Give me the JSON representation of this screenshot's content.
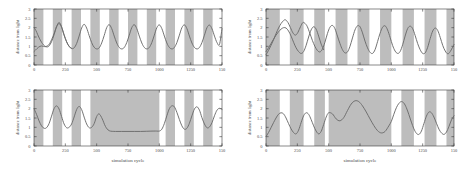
{
  "figure": {
    "background": "#ffffff",
    "axis_color": "#3a3a3a",
    "curve_color": "#6b6b6b",
    "band_color": "#bdbdbd",
    "band_label": "dark phase shading",
    "panel_count": 4
  },
  "axes": {
    "xlabel": "simulation cycle",
    "ylabel": "distance from light",
    "xticks": [
      "0",
      "250",
      "500",
      "750",
      "1000",
      "1250",
      "150"
    ],
    "xtick_values": [
      0,
      250,
      500,
      750,
      1000,
      1250,
      1500
    ],
    "yticks": [
      "0",
      "0.5",
      "1",
      "1.5",
      "2",
      "2.5",
      "3"
    ],
    "ytick_values": [
      0,
      0.5,
      1,
      1.5,
      2,
      2.5,
      3
    ],
    "xlim": [
      0,
      1500
    ],
    "ylim": [
      0,
      3
    ]
  },
  "chart_data": [
    {
      "id": "top-left",
      "type": "line",
      "title": "",
      "xlabel": "",
      "ylabel": "distance from light",
      "xlim": [
        0,
        1500
      ],
      "ylim": [
        0,
        3
      ],
      "grid": false,
      "legend": "none",
      "bands": [
        [
          0,
          75
        ],
        [
          150,
          225
        ],
        [
          300,
          375
        ],
        [
          450,
          525
        ],
        [
          600,
          675
        ],
        [
          750,
          825
        ],
        [
          900,
          975
        ],
        [
          1050,
          1125
        ],
        [
          1200,
          1275
        ],
        [
          1350,
          1425
        ]
      ],
      "series": [
        {
          "name": "agent trajectory A",
          "x": [
            0,
            15,
            30,
            45,
            60,
            75,
            90,
            105,
            120,
            140,
            160,
            180,
            200,
            220,
            240,
            260,
            280,
            300,
            320,
            340,
            360,
            380,
            400,
            420,
            440,
            460,
            480,
            500,
            520,
            540,
            560,
            580,
            600,
            620,
            640,
            660,
            680,
            700,
            720,
            740,
            760,
            780,
            800,
            820,
            840,
            860,
            880,
            900,
            920,
            940,
            960,
            980,
            1000,
            1020,
            1040,
            1060,
            1080,
            1100,
            1120,
            1140,
            1160,
            1180,
            1200,
            1220,
            1240,
            1260,
            1280,
            1300,
            1320,
            1340,
            1360,
            1380,
            1400,
            1420,
            1440,
            1460,
            1480,
            1500
          ],
          "y": [
            2.0,
            1.85,
            1.62,
            1.4,
            1.22,
            1.08,
            1.0,
            0.97,
            1.02,
            1.25,
            1.62,
            2.05,
            2.28,
            2.05,
            1.62,
            1.25,
            1.0,
            0.88,
            0.92,
            1.15,
            1.55,
            1.98,
            2.18,
            1.98,
            1.58,
            1.2,
            0.95,
            0.86,
            0.92,
            1.18,
            1.58,
            2.0,
            2.16,
            1.95,
            1.55,
            1.18,
            0.94,
            0.86,
            0.94,
            1.2,
            1.6,
            2.0,
            2.16,
            1.95,
            1.55,
            1.18,
            0.94,
            0.86,
            0.94,
            1.2,
            1.6,
            2.0,
            2.15,
            1.95,
            1.55,
            1.18,
            0.94,
            0.86,
            0.94,
            1.2,
            1.6,
            2.0,
            2.15,
            1.95,
            1.55,
            1.18,
            0.94,
            0.86,
            0.94,
            1.2,
            1.6,
            2.0,
            2.14,
            1.94,
            1.55,
            1.2,
            1.1,
            1.95
          ]
        },
        {
          "name": "agent trajectory B",
          "x": [
            0,
            12,
            24,
            36,
            48,
            60,
            75,
            90,
            105,
            120,
            140,
            160,
            180,
            200,
            220,
            240,
            260,
            280,
            300
          ],
          "y": [
            0.72,
            0.8,
            0.88,
            0.95,
            1.0,
            1.02,
            1.0,
            0.98,
            1.02,
            1.1,
            1.35,
            1.68,
            2.05,
            2.22,
            2.02,
            1.6,
            1.24,
            1.0,
            0.9
          ]
        }
      ]
    },
    {
      "id": "bottom-left",
      "type": "line",
      "title": "",
      "xlabel": "simulation cycle",
      "ylabel": "distance from light",
      "xlim": [
        0,
        1500
      ],
      "ylim": [
        0,
        3
      ],
      "grid": false,
      "legend": "none",
      "bands": [
        [
          0,
          75
        ],
        [
          150,
          225
        ],
        [
          300,
          375
        ],
        [
          450,
          1000
        ],
        [
          1050,
          1125
        ],
        [
          1200,
          1275
        ],
        [
          1350,
          1425
        ]
      ],
      "series": [
        {
          "name": "agent trajectory",
          "x": [
            0,
            20,
            40,
            60,
            80,
            100,
            120,
            140,
            160,
            180,
            200,
            220,
            240,
            260,
            280,
            300,
            320,
            340,
            360,
            380,
            400,
            420,
            440,
            460,
            480,
            500,
            520,
            545,
            570,
            600,
            650,
            700,
            750,
            800,
            850,
            900,
            950,
            980,
            1000,
            1020,
            1040,
            1060,
            1080,
            1100,
            1120,
            1140,
            1160,
            1180,
            1200,
            1220,
            1240,
            1260,
            1280,
            1300,
            1320,
            1340,
            1360,
            1380,
            1400,
            1420,
            1440,
            1460,
            1480,
            1500
          ],
          "y": [
            2.0,
            1.7,
            1.35,
            1.08,
            0.95,
            0.98,
            1.2,
            1.6,
            2.0,
            2.15,
            1.98,
            1.58,
            1.18,
            0.98,
            1.0,
            1.18,
            1.55,
            1.95,
            2.12,
            1.95,
            1.55,
            1.18,
            0.98,
            1.0,
            1.2,
            1.58,
            1.72,
            1.45,
            1.05,
            0.82,
            0.78,
            0.78,
            0.78,
            0.78,
            0.78,
            0.79,
            0.8,
            0.8,
            0.8,
            0.9,
            1.2,
            1.62,
            2.0,
            2.15,
            2.1,
            1.8,
            1.42,
            1.08,
            0.9,
            0.95,
            1.22,
            1.62,
            1.98,
            2.1,
            1.92,
            1.52,
            1.18,
            0.98,
            1.02,
            1.25,
            1.62,
            1.92,
            2.02,
            1.96
          ]
        }
      ]
    },
    {
      "id": "top-right",
      "type": "line",
      "title": "",
      "xlabel": "",
      "ylabel": "distance from light",
      "xlim": [
        0,
        1500
      ],
      "ylim": [
        0,
        3
      ],
      "grid": false,
      "legend": "none",
      "bands": [
        [
          0,
          110
        ],
        [
          190,
          300
        ],
        [
          385,
          470
        ],
        [
          555,
          650
        ],
        [
          730,
          825
        ],
        [
          910,
          1000
        ],
        [
          1090,
          1180
        ],
        [
          1265,
          1360
        ],
        [
          1440,
          1500
        ]
      ],
      "series": [
        {
          "name": "agent trajectory A",
          "x": [
            0,
            20,
            40,
            60,
            80,
            100,
            120,
            140,
            155,
            175,
            195,
            215,
            235,
            255,
            275,
            295,
            315,
            330,
            350,
            370,
            390,
            410,
            430,
            450,
            470,
            490,
            510,
            530,
            550,
            570,
            590,
            610,
            630,
            650,
            670,
            690,
            710,
            730,
            750,
            770,
            790,
            810,
            830,
            850,
            870,
            890,
            910,
            930,
            950,
            970,
            990,
            1010,
            1030,
            1050,
            1070,
            1090,
            1110,
            1130,
            1150,
            1170,
            1190,
            1210,
            1230,
            1250,
            1270,
            1290,
            1310,
            1330,
            1350,
            1370,
            1390,
            1410,
            1430,
            1450,
            1470,
            1500
          ],
          "y": [
            0.55,
            0.78,
            1.05,
            1.35,
            1.68,
            1.98,
            2.22,
            2.38,
            2.42,
            2.28,
            2.0,
            1.72,
            1.6,
            1.75,
            2.05,
            2.28,
            2.2,
            2.05,
            1.7,
            1.32,
            1.0,
            0.78,
            0.7,
            0.85,
            1.22,
            1.68,
            2.02,
            2.12,
            1.95,
            1.55,
            1.15,
            0.82,
            0.65,
            0.7,
            1.0,
            1.45,
            1.88,
            2.1,
            2.05,
            1.72,
            1.28,
            0.92,
            0.68,
            0.62,
            0.82,
            1.25,
            1.7,
            2.02,
            2.1,
            1.88,
            1.48,
            1.05,
            0.75,
            0.62,
            0.72,
            1.08,
            1.55,
            1.95,
            2.08,
            1.95,
            1.58,
            1.15,
            0.82,
            0.62,
            0.65,
            0.95,
            1.42,
            1.82,
            1.98,
            1.85,
            1.48,
            1.05,
            0.75,
            0.6,
            0.72,
            1.1,
            1.9
          ]
        },
        {
          "name": "agent trajectory B",
          "x": [
            0,
            20,
            40,
            60,
            80,
            100,
            120,
            140,
            160,
            180,
            200,
            220,
            240,
            260,
            280,
            300,
            320,
            340,
            360,
            380,
            400,
            420,
            440,
            460
          ],
          "y": [
            0.72,
            0.92,
            1.15,
            1.38,
            1.6,
            1.78,
            1.92,
            2.0,
            1.98,
            1.82,
            1.55,
            1.22,
            0.92,
            0.72,
            0.62,
            0.72,
            1.05,
            1.5,
            1.88,
            2.05,
            1.92,
            1.55,
            1.12,
            0.82
          ]
        }
      ]
    },
    {
      "id": "bottom-right",
      "type": "line",
      "title": "",
      "xlabel": "simulation cycle",
      "ylabel": "distance from light",
      "xlim": [
        0,
        1500
      ],
      "ylim": [
        0,
        3
      ],
      "grid": false,
      "legend": "none",
      "bands": [
        [
          0,
          110
        ],
        [
          190,
          300
        ],
        [
          385,
          470
        ],
        [
          500,
          1000
        ],
        [
          1080,
          1180
        ],
        [
          1265,
          1360
        ],
        [
          1440,
          1500
        ]
      ],
      "series": [
        {
          "name": "agent trajectory",
          "x": [
            0,
            20,
            40,
            60,
            80,
            100,
            120,
            140,
            160,
            180,
            200,
            220,
            240,
            260,
            280,
            300,
            320,
            340,
            360,
            380,
            400,
            420,
            440,
            460,
            480,
            500,
            530,
            560,
            590,
            620,
            650,
            680,
            710,
            740,
            770,
            800,
            830,
            860,
            890,
            920,
            950,
            980,
            1000,
            1020,
            1040,
            1060,
            1080,
            1100,
            1120,
            1140,
            1160,
            1180,
            1200,
            1220,
            1240,
            1260,
            1280,
            1300,
            1320,
            1340,
            1360,
            1380,
            1400,
            1420,
            1440,
            1460,
            1480,
            1500
          ],
          "y": [
            0.5,
            0.72,
            0.98,
            1.25,
            1.5,
            1.7,
            1.78,
            1.72,
            1.5,
            1.2,
            0.92,
            0.72,
            0.65,
            0.85,
            1.25,
            1.62,
            1.78,
            1.7,
            1.42,
            1.08,
            0.8,
            0.65,
            0.78,
            1.15,
            1.55,
            1.78,
            1.72,
            1.45,
            1.35,
            1.52,
            1.9,
            2.25,
            2.42,
            2.38,
            2.15,
            1.82,
            1.45,
            1.1,
            0.82,
            0.7,
            0.78,
            1.08,
            1.32,
            1.7,
            2.05,
            2.28,
            2.38,
            2.3,
            2.05,
            1.68,
            1.28,
            0.92,
            0.68,
            0.62,
            0.8,
            1.2,
            1.6,
            1.82,
            1.78,
            1.55,
            1.22,
            0.9,
            0.7,
            0.62,
            0.75,
            1.05,
            1.4,
            1.62
          ]
        }
      ]
    }
  ]
}
